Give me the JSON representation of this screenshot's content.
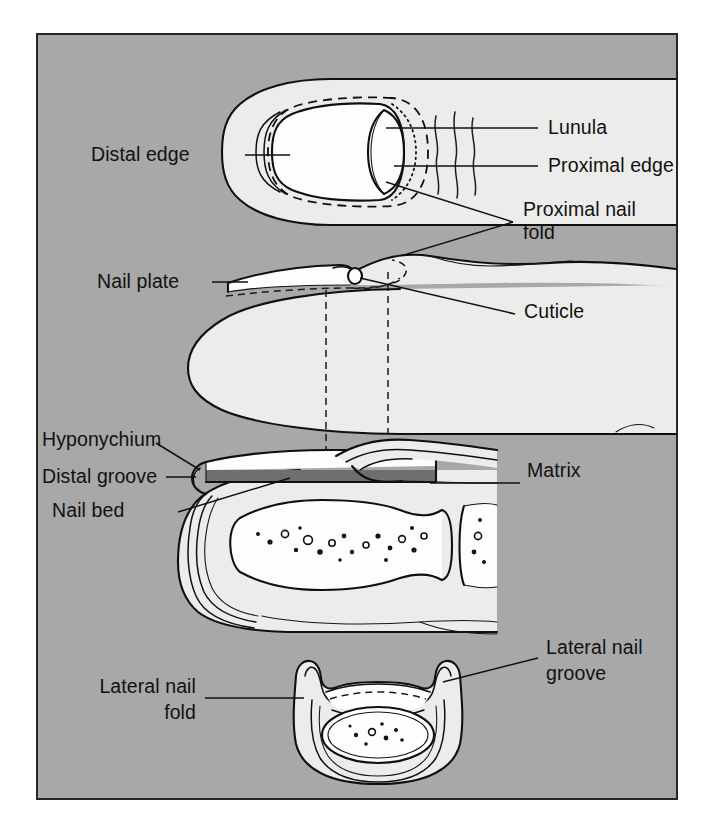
{
  "figure": {
    "panel_background_color": "#a8a8a8",
    "panel_border_color": "#262626",
    "page_background_color": "#ffffff",
    "skin_fill_color": "#ececeb",
    "nail_bed_band_color": "#6f6f6f",
    "line_color": "#111111"
  },
  "labels": {
    "distal_edge": "Distal edge",
    "lunula": "Lunula",
    "proximal_edge": "Proximal edge",
    "proximal_nail_fold_line1": "Proximal nail",
    "proximal_nail_fold_line2": "fold",
    "nail_plate": "Nail plate",
    "cuticle": "Cuticle",
    "hyponychium": "Hyponychium",
    "distal_groove": "Distal groove",
    "nail_bed": "Nail bed",
    "matrix": "Matrix",
    "lateral_nail_groove_line1": "Lateral nail",
    "lateral_nail_groove_line2": "groove",
    "lateral_nail_fold_line1": "Lateral nail",
    "lateral_nail_fold_line2": "fold"
  },
  "views": {
    "dorsal": "Dorsal view of fingertip and nail",
    "sagittal_external": "Lateral external view of fingertip",
    "sagittal_section": "Longitudinal section through fingertip",
    "cross_section": "Transverse cross-section through nail"
  }
}
